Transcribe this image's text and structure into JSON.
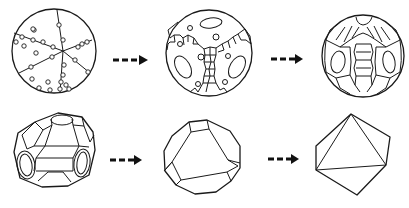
{
  "diagram": {
    "title": "",
    "stages": [
      {
        "id": "stage-1",
        "label": "",
        "shape": "sphere-with-radial-lines-and-dots"
      },
      {
        "id": "stage-2",
        "label": "",
        "shape": "sphere-with-cell-network-and-ovals"
      },
      {
        "id": "stage-3",
        "label": "",
        "shape": "sphere-with-faceted-bands"
      },
      {
        "id": "stage-4",
        "label": "",
        "shape": "rounded-truncated-polyhedron"
      },
      {
        "id": "stage-5",
        "label": "",
        "shape": "truncated-octahedron"
      },
      {
        "id": "stage-6",
        "label": "",
        "shape": "octahedron"
      }
    ],
    "arrows": [
      {
        "from": "stage-1",
        "to": "stage-2",
        "style": "dashed"
      },
      {
        "from": "stage-2",
        "to": "stage-3",
        "style": "dashed"
      },
      {
        "from": "stage-4",
        "to": "stage-5",
        "style": "dashed"
      },
      {
        "from": "stage-5",
        "to": "stage-6",
        "style": "dashed"
      }
    ],
    "colors": {
      "stroke": "#1a1a1a",
      "background": "#ffffff"
    }
  }
}
